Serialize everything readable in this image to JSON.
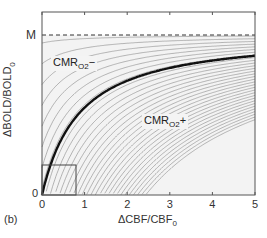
{
  "chart_data": {
    "type": "line",
    "title": "",
    "panel_label": "(b)",
    "xlabel": "ΔCBF/CBF",
    "xlabel_sub": "0",
    "ylabel": "ΔBOLD/BOLD",
    "ylabel_sub": "0",
    "xlim": [
      0,
      5
    ],
    "ylim": [
      0,
      "M"
    ],
    "x_ticks": [
      "0",
      "1",
      "2",
      "3",
      "4",
      "5"
    ],
    "y_ticks": [
      "0",
      "M"
    ],
    "asymptote": {
      "label": "M",
      "style": "dashed"
    },
    "thick_curve": {
      "description": "constant CMRO2 (iso-metabolic) curve",
      "x": [
        0,
        0.25,
        0.5,
        1,
        1.5,
        2,
        3,
        4,
        5
      ],
      "y_fraction_of_M": [
        0,
        0.22,
        0.37,
        0.55,
        0.65,
        0.71,
        0.79,
        0.84,
        0.87
      ]
    },
    "family_curves": "family of thin grey contour curves of varying CMRO2 change, all approaching M",
    "regions": [
      {
        "label": "CMR",
        "sub": "O2",
        "sign": "−",
        "position": "above thick curve"
      },
      {
        "label": "CMR",
        "sub": "O2",
        "sign": "+",
        "position": "below thick curve"
      }
    ],
    "inset_box": {
      "x": [
        0,
        0.8
      ],
      "y_fraction_of_M": [
        0,
        0.19
      ]
    }
  },
  "labels": {
    "panel": "(b)",
    "x_axis": "ΔCBF/CBF",
    "x_axis_sub": "0",
    "y_axis": "ΔBOLD/BOLD",
    "y_axis_sub": "0",
    "y_top": "M",
    "y_zero": "0",
    "x0": "0",
    "x1": "1",
    "x2": "2",
    "x3": "3",
    "x4": "4",
    "x5": "5",
    "minus_region": "CMR",
    "minus_sub": "O2",
    "minus_sign": "−",
    "plus_region": "CMR",
    "plus_sub": "O2",
    "plus_sign": "+"
  }
}
